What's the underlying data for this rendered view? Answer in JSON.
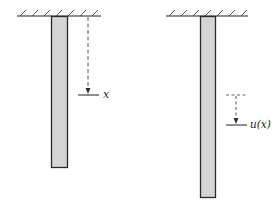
{
  "diagram": {
    "colors": {
      "bar_fill": "#d4d4d4",
      "bar_stroke": "#2a2a2a",
      "line": "#222222",
      "dashed": "#444444"
    },
    "left_figure": {
      "coordinate_label": "x"
    },
    "right_figure": {
      "displacement_label": "u(x)"
    }
  }
}
